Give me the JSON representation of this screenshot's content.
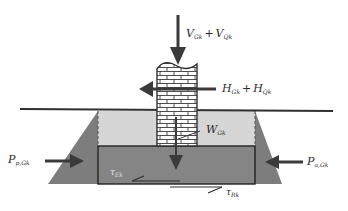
{
  "diagram": {
    "type": "foundation-force-diagram",
    "colors": {
      "background": "#ffffff",
      "soil_dark": "#7d7d7d",
      "backfill_light": "#d6d6d6",
      "footing": "#858585",
      "line": "#2f2f2f",
      "arrow": "#3a3a3a",
      "brick_fill": "#ffffff",
      "brick_line": "#3a3a3a"
    },
    "labels": {
      "vertical_load": {
        "main1": "V",
        "sub1": "Gk",
        "op": "+",
        "main2": "V",
        "sub2": "Qk"
      },
      "horizontal_load": {
        "main1": "H",
        "sub1": "Gk",
        "op": "+",
        "main2": "H",
        "sub2": "Qk"
      },
      "self_weight": {
        "main": "W",
        "sub": "Gk"
      },
      "passive_pressure": {
        "main": "P",
        "sub": "p,Gk"
      },
      "active_pressure": {
        "main": "P",
        "sub": "a,Gk"
      },
      "shear_ek": {
        "main": "τ",
        "sub": "Ek"
      },
      "shear_rk": {
        "main": "τ",
        "sub": "Rk"
      }
    },
    "elements": [
      "ground-surface-line",
      "brick-column",
      "backfill",
      "footing",
      "sloped-soil-excavation",
      "vertical-load-arrow",
      "horizontal-load-arrow",
      "self-weight-arrow",
      "passive-pressure-arrow",
      "active-pressure-arrow",
      "base-shear-action-arrow",
      "base-shear-resistance-arrow"
    ]
  }
}
